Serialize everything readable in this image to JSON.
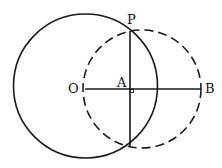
{
  "diagram": {
    "labels": {
      "P": "P",
      "O": "O",
      "A": "A",
      "B": "B"
    },
    "colors": {
      "stroke": "#1a1a1a",
      "background": "#ffffff"
    },
    "elements": [
      "solid circle centered at O",
      "dashed circle centered at B passing through O",
      "segment OB",
      "common chord through P perpendicular to OB at A",
      "right-angle marker at A"
    ]
  }
}
